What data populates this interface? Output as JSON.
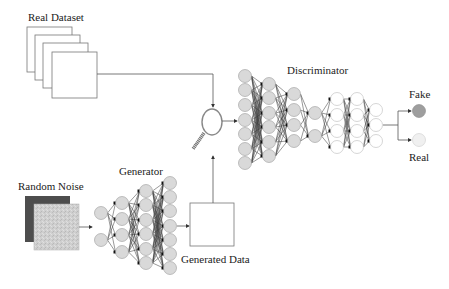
{
  "labels": {
    "real_dataset": "Real Dataset",
    "random_noise": "Random Noise",
    "generator": "Generator",
    "generated_data": "Generated Data",
    "discriminator": "Discriminator",
    "fake": "Fake",
    "real": "Real"
  },
  "icons": {
    "evaluator": "magnifying-glass-icon"
  },
  "colors": {
    "node_gray": "#d9d9d9",
    "node_white": "#ffffff",
    "node_stroke": "#9a9a9a",
    "fake_output": "#9e9e9e",
    "real_output": "#f0f0f0",
    "noise_dark": "#4d4d4d",
    "noise_light": "#cccccc",
    "line": "#555555"
  },
  "generator": {
    "layers": [
      {
        "x": 101,
        "nodes": [
          213,
          240
        ],
        "fill": "gray"
      },
      {
        "x": 122,
        "nodes": [
          203,
          219,
          235,
          252
        ],
        "fill": "gray"
      },
      {
        "x": 146,
        "nodes": [
          191,
          205,
          220,
          234,
          249,
          263
        ],
        "fill": "gray"
      },
      {
        "x": 170,
        "nodes": [
          183,
          197,
          211,
          226,
          240,
          254,
          268
        ],
        "fill": "gray"
      }
    ]
  },
  "discriminator": {
    "layers": [
      {
        "x": 245,
        "nodes": [
          76,
          90,
          105,
          120,
          134,
          149,
          163
        ],
        "fill": "gray"
      },
      {
        "x": 269,
        "nodes": [
          84,
          98,
          113,
          127,
          142,
          156
        ],
        "fill": "gray"
      },
      {
        "x": 294,
        "nodes": [
          94,
          110,
          125,
          141
        ],
        "fill": "gray"
      },
      {
        "x": 315,
        "nodes": [
          113,
          136
        ],
        "fill": "gray"
      },
      {
        "x": 337,
        "nodes": [
          99,
          115,
          131,
          147
        ],
        "fill": "white"
      },
      {
        "x": 357,
        "nodes": [
          99,
          115,
          131,
          147
        ],
        "fill": "white"
      },
      {
        "x": 376,
        "nodes": [
          110,
          125,
          141
        ],
        "fill": "white"
      }
    ]
  },
  "outputs": [
    {
      "name": "Fake",
      "x": 419,
      "y": 111
    },
    {
      "name": "Real",
      "x": 419,
      "y": 140
    }
  ]
}
